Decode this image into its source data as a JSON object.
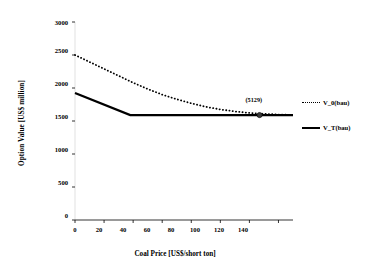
{
  "chart_data": {
    "type": "line",
    "title": "",
    "xlabel": "Coal Price [US$/short ton]",
    "ylabel": "Option Value [US$ million]",
    "xlim": [
      0,
      150
    ],
    "ylim": [
      0,
      3000
    ],
    "xticks": [
      0,
      20,
      40,
      60,
      80,
      100,
      120,
      140
    ],
    "xtick_labels": [
      "0",
      "20",
      "40",
      "60",
      "80",
      "100",
      "120",
      "140"
    ],
    "yticks": [
      0,
      500,
      1000,
      1500,
      2000,
      2500,
      3000
    ],
    "ytick_labels": [
      "0",
      "500",
      "1000",
      "1500",
      "2000",
      "2500",
      "3000"
    ],
    "grid": false,
    "legend_position": "right",
    "series": [
      {
        "name": "V_0(bau)",
        "style": "dotted",
        "x": [
          0,
          10,
          20,
          30,
          40,
          50,
          60,
          70,
          80,
          90,
          100,
          110,
          120,
          130,
          140,
          150
        ],
        "values": [
          2500,
          2395,
          2290,
          2185,
          2080,
          1985,
          1900,
          1830,
          1768,
          1715,
          1675,
          1645,
          1622,
          1608,
          1598,
          1592
        ]
      },
      {
        "name": "V_T(bau)",
        "style": "solid",
        "x": [
          0,
          38,
          150
        ],
        "values": [
          1925,
          1590,
          1590
        ]
      }
    ],
    "annotations": [
      {
        "text": "(5129)",
        "x": 127,
        "y": 1590,
        "marker": "circle"
      }
    ]
  },
  "legend": {
    "items": [
      {
        "label": "V_0(bau)",
        "style": "dotted"
      },
      {
        "label": "V_T(bau)",
        "style": "solid"
      }
    ]
  }
}
